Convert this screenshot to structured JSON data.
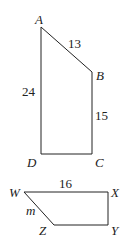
{
  "figure1": {
    "vertices": {
      "A": "A",
      "B": "B",
      "C": "C",
      "D": "D"
    },
    "sides": {
      "AB": "13",
      "AD": "24",
      "BC": "15"
    }
  },
  "figure2": {
    "vertices": {
      "W": "W",
      "X": "X",
      "Y": "Y",
      "Z": "Z"
    },
    "sides": {
      "WX": "16",
      "WZ": "m"
    }
  },
  "colors": {
    "stroke": "#222222",
    "background": "#ffffff"
  }
}
